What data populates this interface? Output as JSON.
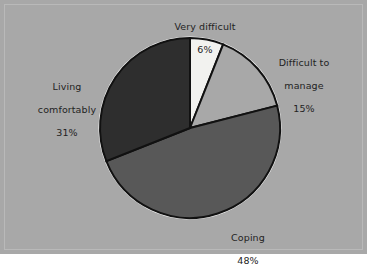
{
  "chart_data": {
    "type": "pie",
    "title": "",
    "subtitle": "",
    "xlabel": "",
    "ylabel": "",
    "legend_position": "none",
    "grid": false,
    "labels_inline": true,
    "categories": [
      "Very difficult",
      "Difficult to manage",
      "Coping",
      "Living comfortably"
    ],
    "values": [
      6,
      15,
      48,
      31
    ],
    "value_unit": "%",
    "slices": [
      {
        "label": "Very difficult",
        "label_line1": "Very difficult",
        "value": 6,
        "value_text": "6%",
        "color": "#f2f2ef",
        "start_angle_deg": 0,
        "end_angle_deg": 21.6
      },
      {
        "label": "Difficult to manage",
        "label_line1": "Difficult to",
        "label_line2": "manage",
        "value": 15,
        "value_text": "15%",
        "color": "#a8a8a8",
        "start_angle_deg": 21.6,
        "end_angle_deg": 75.6
      },
      {
        "label": "Coping",
        "label_line1": "Coping",
        "value": 48,
        "value_text": "48%",
        "color": "#585858",
        "start_angle_deg": 75.6,
        "end_angle_deg": 248.4
      },
      {
        "label": "Living comfortably",
        "label_line1": "Living",
        "label_line2": "comfortably",
        "value": 31,
        "value_text": "31%",
        "color": "#2e2e2e",
        "start_angle_deg": 248.4,
        "end_angle_deg": 360
      }
    ]
  },
  "figure": {
    "background_color": "#a8a8a8",
    "frame_color": "#b9b9b9",
    "pie_outline_color": "#ffffff",
    "slice_separator_color": "#111111",
    "label_text_color": "#232323"
  }
}
